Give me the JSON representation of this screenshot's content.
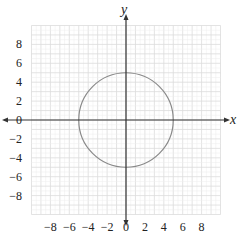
{
  "chart_data": {
    "type": "line",
    "title": "",
    "xlabel": "x",
    "ylabel": "y",
    "xlim": [
      -10,
      10
    ],
    "ylim": [
      -10,
      10
    ],
    "grid": true,
    "x_ticks": [
      -8,
      -6,
      -4,
      -2,
      0,
      2,
      4,
      6,
      8
    ],
    "y_ticks": [
      8,
      6,
      4,
      2,
      0,
      -2,
      -4,
      -6,
      -8
    ],
    "x_tick_labels": [
      "−8",
      "−6",
      "−4",
      "−2",
      "0",
      "2",
      "4",
      "6",
      "8"
    ],
    "y_tick_labels": [
      "8",
      "6",
      "4",
      "2",
      "0",
      "−2",
      "−4",
      "−6",
      "−8"
    ],
    "series": [
      {
        "name": "circle",
        "equation": "x^2 + y^2 = 25",
        "center": [
          0,
          0
        ],
        "radius": 5,
        "color": "#8a8a8a"
      }
    ],
    "legend": null
  },
  "colors": {
    "axis": "#333333",
    "grid_minor": "#ececec",
    "grid_major": "#dcdcdc",
    "curve": "#8a8a8a"
  }
}
